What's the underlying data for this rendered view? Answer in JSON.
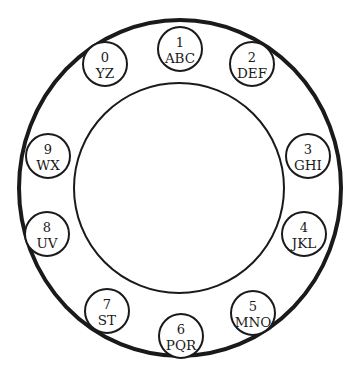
{
  "diagram": {
    "type": "rotary-phone-dial",
    "colors": {
      "background": "#ffffff",
      "stroke": "#1a1a1a",
      "text": "#1a1a1a"
    },
    "outer_ring": {
      "cx": 180,
      "cy": 188,
      "rx": 161,
      "ry": 168,
      "stroke_width": 4
    },
    "inner_circle": {
      "cx": 179,
      "cy": 188,
      "r": 105,
      "stroke_width": 2
    },
    "finger_hole_radius": 22,
    "holes": [
      {
        "digit": "1",
        "letters": "ABC",
        "cx": 180,
        "cy": 49
      },
      {
        "digit": "2",
        "letters": "DEF",
        "cx": 252,
        "cy": 64
      },
      {
        "digit": "3",
        "letters": "GHI",
        "cx": 308,
        "cy": 156
      },
      {
        "digit": "4",
        "letters": "JKL",
        "cx": 304,
        "cy": 234
      },
      {
        "digit": "5",
        "letters": "MNO",
        "cx": 253,
        "cy": 313
      },
      {
        "digit": "6",
        "letters": "PQR",
        "cx": 181,
        "cy": 336
      },
      {
        "digit": "7",
        "letters": "ST",
        "cx": 107,
        "cy": 311
      },
      {
        "digit": "8",
        "letters": "UV",
        "cx": 47,
        "cy": 234
      },
      {
        "digit": "9",
        "letters": "WX",
        "cx": 48,
        "cy": 156
      },
      {
        "digit": "0",
        "letters": "YZ",
        "cx": 105,
        "cy": 64
      }
    ]
  }
}
